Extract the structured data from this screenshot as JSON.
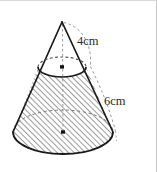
{
  "figure": {
    "shape": "cone",
    "labels": {
      "upper_segment": "4cm",
      "lower_segment": "6cm"
    },
    "colors": {
      "outline": "#1a1a1a",
      "hatch": "#4a4a4a",
      "dashed_guide": "#8f8f8f",
      "background": "#ffffff",
      "border": "#d2d2d2",
      "text": "#2b2b2b"
    },
    "geometry": {
      "apex": {
        "x": 62,
        "y": 22
      },
      "cut_ellipse": {
        "cx": 62,
        "cy": 68,
        "rx": 24,
        "ry": 10
      },
      "base_ellipse": {
        "cx": 63,
        "cy": 132,
        "rx": 50,
        "ry": 22
      },
      "axis": {
        "x": 62.5,
        "y_top": 22,
        "y_bottom": 132
      },
      "center_dots": [
        {
          "x": 62,
          "y": 67
        },
        {
          "x": 63,
          "y": 132
        }
      ],
      "hatched_region": "frustum-below-cut-plane"
    },
    "annotations": {
      "upper_arc": "dashed arc from apex to cut-plane rim",
      "lower_arc": "dashed arc from cut-plane rim to base rim"
    }
  }
}
